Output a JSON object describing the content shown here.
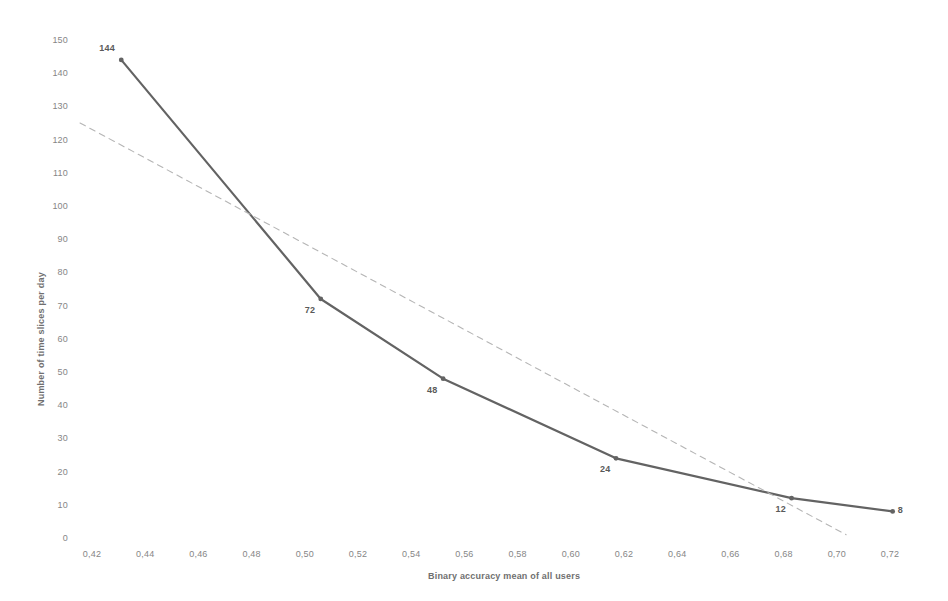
{
  "chart_data": {
    "type": "line",
    "title": "",
    "xlabel": "Binary accuracy mean of all users",
    "ylabel": "Number of time slices per day",
    "xlim": [
      0.41,
      0.73
    ],
    "ylim": [
      0,
      150
    ],
    "grid": false,
    "legend": "none",
    "decimal_separator": ",",
    "x_ticks": [
      "0,42",
      "0,44",
      "0,46",
      "0,48",
      "0,50",
      "0,52",
      "0,54",
      "0,56",
      "0,58",
      "0,60",
      "0,62",
      "0,64",
      "0,66",
      "0,68",
      "0,70",
      "0,72"
    ],
    "x_tick_values": [
      0.42,
      0.44,
      0.46,
      0.48,
      0.5,
      0.52,
      0.54,
      0.56,
      0.58,
      0.6,
      0.62,
      0.64,
      0.66,
      0.68,
      0.7,
      0.72
    ],
    "y_ticks": [
      "0",
      "10",
      "20",
      "30",
      "40",
      "50",
      "60",
      "70",
      "80",
      "90",
      "100",
      "110",
      "120",
      "130",
      "140",
      "150"
    ],
    "y_tick_values": [
      0,
      10,
      20,
      30,
      40,
      50,
      60,
      70,
      80,
      90,
      100,
      110,
      120,
      130,
      140,
      150
    ],
    "series": [
      {
        "name": "Number of time slices per day",
        "style": "solid",
        "color": "#636363",
        "marker": true,
        "labels_shown": true,
        "points": [
          {
            "x": 0.431,
            "y": 144,
            "label": "144"
          },
          {
            "x": 0.506,
            "y": 72,
            "label": "72"
          },
          {
            "x": 0.552,
            "y": 48,
            "label": "48"
          },
          {
            "x": 0.617,
            "y": 24,
            "label": "24"
          },
          {
            "x": 0.683,
            "y": 12,
            "label": "12"
          },
          {
            "x": 0.721,
            "y": 8,
            "label": "8"
          }
        ]
      },
      {
        "name": "Trendline",
        "style": "dashed",
        "color": "#b5b5b5",
        "marker": false,
        "labels_shown": false,
        "points": [
          {
            "x": 0.4155,
            "y": 125,
            "label": ""
          },
          {
            "x": 0.7035,
            "y": 1,
            "label": ""
          }
        ]
      }
    ]
  }
}
